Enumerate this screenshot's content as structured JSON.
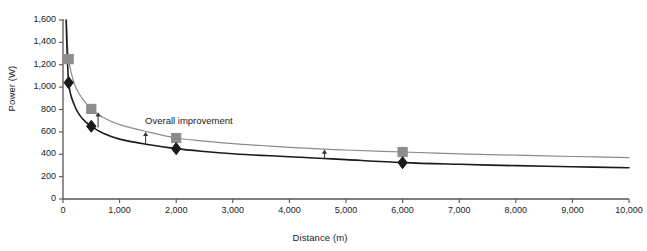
{
  "chart_data": {
    "type": "line",
    "title": "",
    "xlabel": "Distance (m)",
    "ylabel": "Power (W)",
    "xlim": [
      0,
      10000
    ],
    "ylim": [
      0,
      1600
    ],
    "xticks": [
      "0",
      "1,000",
      "2,000",
      "3,000",
      "4,000",
      "5,000",
      "6,000",
      "7,000",
      "8,000",
      "9,000",
      "10,000"
    ],
    "xtick_values": [
      0,
      1000,
      2000,
      3000,
      4000,
      5000,
      6000,
      7000,
      8000,
      9000,
      10000
    ],
    "yticks": [
      "0",
      "200",
      "400",
      "600",
      "800",
      "1,000",
      "1,200",
      "1,400",
      "1,600"
    ],
    "ytick_values": [
      0,
      200,
      400,
      600,
      800,
      1000,
      1200,
      1400,
      1600
    ],
    "grid": false,
    "legend": "none",
    "series": [
      {
        "name": "upper-curve",
        "marker": "square",
        "color": "#8c8c8c",
        "line_color": "#8c8c8c",
        "x": [
          60,
          100,
          200,
          300,
          400,
          500,
          700,
          1000,
          1500,
          2000,
          2500,
          3000,
          3500,
          4000,
          4600,
          5000,
          6000,
          7000,
          8000,
          9000,
          10000
        ],
        "y": [
          1600,
          1250,
          1030,
          930,
          860,
          805,
          730,
          665,
          600,
          545,
          518,
          495,
          478,
          462,
          445,
          438,
          420,
          404,
          392,
          380,
          370
        ],
        "marker_points": [
          {
            "x": 100,
            "y": 1250
          },
          {
            "x": 500,
            "y": 805
          },
          {
            "x": 2000,
            "y": 545
          },
          {
            "x": 6000,
            "y": 420
          }
        ]
      },
      {
        "name": "lower-curve",
        "marker": "diamond",
        "color": "#1a1a1a",
        "line_color": "#1a1a1a",
        "x": [
          55,
          100,
          200,
          300,
          400,
          500,
          700,
          1000,
          1500,
          2000,
          2500,
          3000,
          3500,
          4000,
          4600,
          5000,
          6000,
          7000,
          8000,
          9000,
          10000
        ],
        "y": [
          1600,
          1040,
          840,
          745,
          690,
          650,
          590,
          535,
          487,
          450,
          425,
          405,
          390,
          378,
          362,
          352,
          325,
          310,
          298,
          288,
          280
        ],
        "marker_points": [
          {
            "x": 100,
            "y": 1040
          },
          {
            "x": 500,
            "y": 650
          },
          {
            "x": 2000,
            "y": 450
          },
          {
            "x": 6000,
            "y": 325
          }
        ]
      }
    ],
    "annotations": [
      {
        "text": "Overall improvement",
        "x": 1450,
        "y": 700,
        "type": "label"
      },
      {
        "x": 620,
        "y_from": 640,
        "y_to": 775,
        "type": "arrow-up"
      },
      {
        "x": 1460,
        "y_from": 490,
        "y_to": 600,
        "type": "arrow-up"
      },
      {
        "x": 4620,
        "y_from": 365,
        "y_to": 442,
        "type": "arrow-up"
      }
    ]
  },
  "axis": {
    "x_title": "Distance (m)",
    "y_title": "Power (W)"
  }
}
